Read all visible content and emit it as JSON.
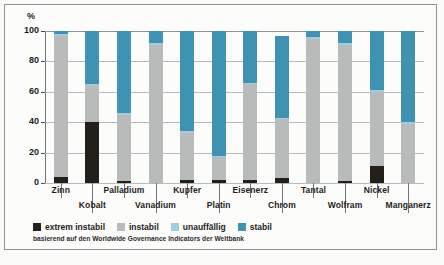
{
  "chart_data": {
    "type": "bar",
    "title": "",
    "subtitle": "",
    "xlabel": "",
    "ylabel": "%",
    "ylim": [
      0,
      100
    ],
    "yticks": [
      0,
      20,
      40,
      60,
      80,
      100
    ],
    "ytick_labels": [
      "0",
      "20",
      "40",
      "60",
      "80",
      "100"
    ],
    "grid": true,
    "stacked": true,
    "legend_position": "bottom-left",
    "categories": [
      "Zinn",
      "Kobalt",
      "Palladium",
      "Vanadium",
      "Kupfer",
      "Platin",
      "Eisenerz",
      "Chrom",
      "Tantal",
      "Wolfram",
      "Nickel",
      "Manganerz"
    ],
    "series": [
      {
        "name": "extrem instabil",
        "color": "#231f1b",
        "values": [
          4,
          40,
          1,
          0,
          2,
          2,
          2,
          3,
          0,
          1,
          11,
          0
        ]
      },
      {
        "name": "instabil",
        "color": "#b9baba",
        "values": [
          93,
          24,
          44,
          91,
          31,
          15,
          63,
          39,
          95,
          90,
          49,
          39
        ]
      },
      {
        "name": "unauffällig",
        "color": "#9ecde0",
        "values": [
          1,
          1,
          1,
          1,
          1,
          1,
          1,
          1,
          1,
          1,
          1,
          1
        ]
      },
      {
        "name": "stabil",
        "color": "#3f93b2",
        "values": [
          2,
          35,
          54,
          8,
          66,
          82,
          34,
          54,
          4,
          8,
          39,
          60
        ]
      }
    ],
    "annotations": {
      "source": "basierend auf den Worldwide Governance Indicators der Weltbank"
    }
  },
  "legend": {
    "items": [
      {
        "label": "extrem instabil",
        "color": "#231f1b"
      },
      {
        "label": "instabil",
        "color": "#b9baba"
      },
      {
        "label": "unauffällig",
        "color": "#9ecde0"
      },
      {
        "label": "stabil",
        "color": "#3f93b2"
      }
    ]
  },
  "axis": {
    "unit": "%",
    "ticks": [
      "100",
      "80",
      "60",
      "40",
      "20",
      "0"
    ]
  },
  "source_note": "basierend auf den Worldwide Governance Indicators der Weltbank"
}
